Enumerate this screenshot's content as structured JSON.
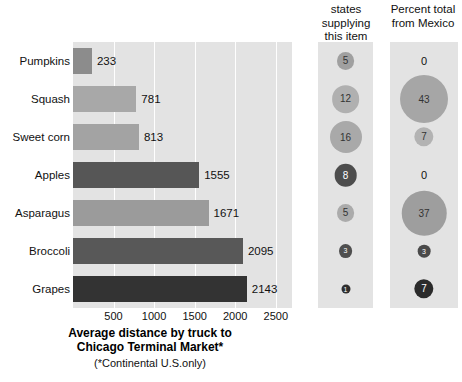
{
  "chart_data": {
    "type": "bar",
    "title": "Average distance by truck to\nChicago Terminal Market*",
    "subtitle": "(*Continental U.S.only)",
    "xlabel": "",
    "ylabel": "",
    "xlim": [
      0,
      2700
    ],
    "grid": true,
    "legend": "none",
    "categories": [
      "Pumpkins",
      "Squash",
      "Sweet corn",
      "Apples",
      "Asparagus",
      "Broccoli",
      "Grapes"
    ],
    "values": [
      233,
      781,
      813,
      1555,
      1671,
      2095,
      2143
    ],
    "value_labels": [
      "233",
      "781",
      "813",
      "1555",
      "1671",
      "2095",
      "2143"
    ],
    "bar_colors": [
      "#8c8c8c",
      "#a8a8a8",
      "#a3a3a3",
      "#565656",
      "#9b9b9b",
      "#585858",
      "#333333"
    ],
    "xticks": [
      500,
      1000,
      1500,
      2000,
      2500
    ],
    "xtick_labels": [
      "500",
      "1000",
      "1500",
      "2000",
      "2500"
    ],
    "panels": [
      {
        "name": "states-supplying",
        "header": "states\nsupplying\nthis item",
        "type": "bubble",
        "values": [
          5,
          12,
          16,
          8,
          5,
          3,
          1
        ],
        "labels": [
          "5",
          "12",
          "16",
          "8",
          "5",
          "3",
          "1"
        ],
        "colors": [
          "#a0a0a0",
          "#b0b0b0",
          "#a9a9a9",
          "#4d4d4d",
          "#ababab",
          "#4f4f4f",
          "#2e2e2e"
        ],
        "text_colors": [
          "#333333",
          "#333333",
          "#333333",
          "#ffffff",
          "#333333",
          "#ffffff",
          "#ffffff"
        ]
      },
      {
        "name": "percent-from-mexico",
        "header": "Percent total\nfrom Mexico",
        "type": "bubble",
        "values": [
          0,
          43,
          7,
          0,
          37,
          3,
          7
        ],
        "labels": [
          "0",
          "43",
          "7",
          "0",
          "37",
          "3",
          "7"
        ],
        "colors": [
          "none",
          "#a6a6a6",
          "#b3b3b3",
          "none",
          "#9e9e9e",
          "#4a4a4a",
          "#2b2b2b"
        ],
        "text_colors": [
          "#111111",
          "#333333",
          "#333333",
          "#111111",
          "#333333",
          "#ffffff",
          "#ffffff"
        ]
      }
    ],
    "colors": {
      "panel_background": "#e3e3e3",
      "page_background": "#ffffff",
      "gridline": "#ffffff",
      "text": "#111111"
    }
  }
}
